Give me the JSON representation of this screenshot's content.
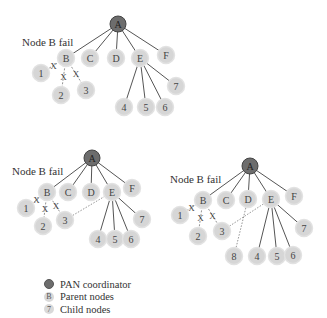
{
  "colors": {
    "coordinator_fill": "#6d6d6d",
    "node_fill": "#d6d6d6",
    "edge": "#555555",
    "text": "#333333"
  },
  "diagrams": [
    {
      "label": "Node B fail",
      "label_pos": [
        22,
        46
      ],
      "nodes": {
        "A": [
          118,
          24,
          "coord"
        ],
        "B": [
          66,
          58
        ],
        "C": [
          90,
          58
        ],
        "D": [
          116,
          58
        ],
        "E": [
          140,
          58
        ],
        "F": [
          166,
          55
        ],
        "1": [
          41,
          73
        ],
        "2": [
          61,
          95
        ],
        "3": [
          86,
          90
        ],
        "4": [
          124,
          107
        ],
        "5": [
          146,
          107
        ],
        "6": [
          165,
          107
        ],
        "7": [
          176,
          86
        ]
      },
      "edges": [
        [
          "A",
          "B"
        ],
        [
          "A",
          "C"
        ],
        [
          "A",
          "D"
        ],
        [
          "A",
          "E"
        ],
        [
          "A",
          "F"
        ],
        [
          "E",
          "4"
        ],
        [
          "E",
          "5"
        ],
        [
          "E",
          "6"
        ],
        [
          "E",
          "7"
        ]
      ],
      "broken_edges": [
        [
          "B",
          "1"
        ],
        [
          "B",
          "2"
        ],
        [
          "B",
          "3"
        ]
      ],
      "dotted_edges": []
    },
    {
      "label": "Node B fail",
      "label_pos": [
        12,
        175
      ],
      "nodes": {
        "A": [
          92,
          158,
          "coord"
        ],
        "B": [
          47,
          192
        ],
        "C": [
          68,
          192
        ],
        "D": [
          91,
          192
        ],
        "E": [
          112,
          192
        ],
        "F": [
          132,
          188
        ],
        "1": [
          26,
          208
        ],
        "2": [
          43,
          226
        ],
        "3": [
          65,
          220
        ],
        "4": [
          98,
          239
        ],
        "5": [
          115,
          239
        ],
        "6": [
          131,
          239
        ],
        "7": [
          142,
          219
        ]
      },
      "edges": [
        [
          "A",
          "B"
        ],
        [
          "A",
          "C"
        ],
        [
          "A",
          "D"
        ],
        [
          "A",
          "E"
        ],
        [
          "A",
          "F"
        ],
        [
          "E",
          "4"
        ],
        [
          "E",
          "5"
        ],
        [
          "E",
          "6"
        ],
        [
          "E",
          "7"
        ]
      ],
      "broken_edges": [
        [
          "B",
          "1"
        ],
        [
          "B",
          "2"
        ],
        [
          "B",
          "3"
        ]
      ],
      "dotted_edges": [
        [
          "3",
          "E"
        ]
      ]
    },
    {
      "label": "Node B fail",
      "label_pos": [
        170,
        183
      ],
      "nodes": {
        "A": [
          250,
          166,
          "coord"
        ],
        "B": [
          203,
          200
        ],
        "C": [
          226,
          200
        ],
        "D": [
          248,
          199
        ],
        "E": [
          271,
          199
        ],
        "F": [
          294,
          196
        ],
        "1": [
          180,
          215
        ],
        "2": [
          198,
          236
        ],
        "3": [
          222,
          231
        ],
        "4": [
          257,
          256
        ],
        "5": [
          277,
          256
        ],
        "6": [
          293,
          255
        ],
        "7": [
          304,
          228
        ],
        "8": [
          234,
          256
        ]
      },
      "edges": [
        [
          "A",
          "B"
        ],
        [
          "A",
          "C"
        ],
        [
          "A",
          "D"
        ],
        [
          "A",
          "E"
        ],
        [
          "A",
          "F"
        ],
        [
          "E",
          "4"
        ],
        [
          "E",
          "5"
        ],
        [
          "E",
          "6"
        ],
        [
          "E",
          "7"
        ]
      ],
      "broken_edges": [
        [
          "B",
          "1"
        ],
        [
          "B",
          "2"
        ],
        [
          "B",
          "3"
        ]
      ],
      "dotted_edges": [
        [
          "3",
          "E"
        ],
        [
          "8",
          "D"
        ]
      ]
    }
  ],
  "legend": {
    "items": [
      {
        "icon": "coord",
        "glyph": "",
        "label": "PAN coordinator"
      },
      {
        "icon": "parent",
        "glyph": "B",
        "label": "Parent nodes"
      },
      {
        "icon": "child",
        "glyph": "7",
        "label": "Child nodes"
      }
    ]
  }
}
